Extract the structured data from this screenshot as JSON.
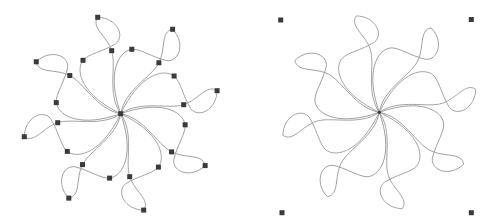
{
  "figures": [
    {
      "name": "pinwheel-with-nodes",
      "center": [
        120.7,
        113.7
      ],
      "show_nodes": true,
      "show_bbox_handles": false
    },
    {
      "name": "pinwheel-selected",
      "center": [
        379.3,
        112.3
      ],
      "show_nodes": false,
      "show_bbox_handles": true,
      "bbox_handles": [
        [
          280.7,
          20
        ],
        [
          471.3,
          19.5
        ],
        [
          282,
          212.7
        ],
        [
          471.3,
          212.7
        ]
      ]
    }
  ],
  "petal": {
    "count": 8,
    "rotation_step_deg": 45,
    "tip": [
      -23,
      -96.4
    ],
    "inner_node": [
      -9,
      -63
    ],
    "outer_node": [
      -37.7,
      -53.4
    ],
    "inner_path": "M0,0 C-14,-20 -4,-48 -9,-63 C-14,-78 -30,-86 -23,-96.4",
    "outer_path": "M-23,-96.4 C-4,-96 5,-78 -5,-70 C-18,-62 -32,-60 -37.7,-53.4 C-46,-42 -38,-18 0,0"
  },
  "colors": {
    "curve": "#9a9a9a",
    "node": "#3a3a3a",
    "background": "#ffffff"
  },
  "node_size": 5
}
